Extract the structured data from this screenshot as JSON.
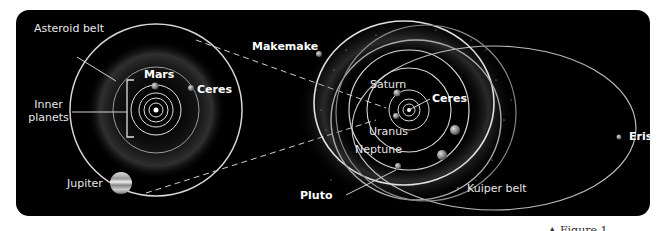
{
  "diagram": {
    "colors": {
      "background": "#000000",
      "orbit": "#d8d8d8",
      "dashed_connector": "#cfcfcf",
      "label": "#e8e8e8"
    },
    "left_panel": {
      "labels": {
        "asteroid_belt": "Asteroid belt",
        "inner_planets": "Inner planets",
        "mars": "Mars",
        "ceres": "Ceres",
        "jupiter": "Jupiter"
      }
    },
    "right_panel": {
      "labels": {
        "makemake": "Makemake",
        "saturn": "Saturn",
        "ceres": "Ceres",
        "uranus": "Uranus",
        "neptune": "Neptune",
        "pluto": "Pluto",
        "kuiper_belt": "Kuiper belt",
        "eris": "Eris"
      }
    },
    "caption_fragment": "▲ Figure 1 ..."
  }
}
